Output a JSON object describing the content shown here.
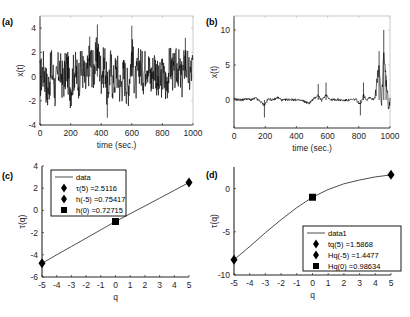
{
  "figure": {
    "panels": [
      "(a)",
      "(b)",
      "(c)",
      "(d)"
    ]
  },
  "chart_data": [
    {
      "id": "a",
      "panel_label": "(a)",
      "type": "line",
      "title": "",
      "xlabel": "time (sec.)",
      "ylabel": "x(t)",
      "xlim": [
        0,
        1000
      ],
      "ylim": [
        -4,
        5
      ],
      "xticks": [
        0,
        200,
        400,
        600,
        800,
        1000
      ],
      "yticks": [
        -4,
        -2,
        0,
        2,
        4
      ],
      "grid": false,
      "description": "Noisy stationary-like time series fluctuating roughly between -3 and 3, peaks near 4.3 at t~375 and ~4.2 at t~600, minimum ~-3.4 at t~440",
      "series": [
        {
          "name": "x(t)",
          "x": [
            0,
            25,
            50,
            75,
            100,
            125,
            150,
            175,
            200,
            225,
            250,
            275,
            300,
            325,
            350,
            375,
            400,
            425,
            440,
            460,
            480,
            500,
            525,
            550,
            575,
            600,
            625,
            650,
            675,
            700,
            725,
            750,
            775,
            800,
            825,
            850,
            875,
            900,
            925,
            950,
            975,
            1000
          ],
          "y": [
            -0.5,
            1.5,
            -2.8,
            1.8,
            -2.5,
            2.0,
            -1.0,
            1.8,
            -2.2,
            1.5,
            -0.5,
            2.0,
            -1.5,
            3.3,
            1.0,
            4.3,
            0.5,
            2.5,
            -3.4,
            2.0,
            -1.5,
            1.8,
            -2.0,
            0.5,
            -2.3,
            4.2,
            -1.5,
            2.5,
            0.5,
            3.0,
            -0.5,
            2.3,
            -1.8,
            0.3,
            -1.5,
            2.5,
            0.2,
            2.3,
            -1.0,
            3.2,
            0.0,
            2.0
          ]
        }
      ]
    },
    {
      "id": "b",
      "panel_label": "(b)",
      "type": "line",
      "title": "",
      "xlabel": "time (sec.)",
      "ylabel": "x(t)",
      "xlim": [
        0,
        1000
      ],
      "ylim": [
        -4,
        12
      ],
      "xticks": [
        0,
        200,
        400,
        600,
        800,
        1000
      ],
      "yticks": [
        0,
        5,
        10
      ],
      "grid": false,
      "description": "Mostly flat series near 0 with small spikes, dip ~-2.5 at t~195, spikes ~2.3 at t~540 and ~2.5 at t~590, dip ~-2.2 at t~810, large bursts near end reaching ~7 at t~930 and ~10 at t~960",
      "series": [
        {
          "name": "x(t)",
          "x": [
            0,
            20,
            50,
            80,
            110,
            140,
            170,
            195,
            220,
            250,
            280,
            310,
            350,
            400,
            440,
            480,
            510,
            540,
            560,
            590,
            620,
            660,
            700,
            740,
            780,
            810,
            830,
            850,
            870,
            890,
            910,
            930,
            945,
            960,
            975,
            990,
            1000
          ],
          "y": [
            0.5,
            0.2,
            0.0,
            0.6,
            0.1,
            0.8,
            -0.8,
            -2.5,
            0.6,
            0.0,
            1.2,
            -0.2,
            0.3,
            0.0,
            -0.3,
            -1.6,
            0.5,
            2.3,
            -0.3,
            2.5,
            0.0,
            0.2,
            -0.2,
            0.0,
            0.3,
            -2.2,
            2.5,
            0.0,
            1.5,
            0.2,
            2.0,
            7.0,
            -1.5,
            10.0,
            3.5,
            -1.0,
            0.0
          ]
        }
      ]
    },
    {
      "id": "c",
      "panel_label": "(c)",
      "type": "line",
      "title": "",
      "xlabel": "q",
      "ylabel": "τ(q)",
      "xlim": [
        -5,
        5
      ],
      "ylim": [
        -6,
        4
      ],
      "xticks": [
        -5,
        -4,
        -3,
        -2,
        -1,
        0,
        1,
        2,
        3,
        4,
        5
      ],
      "yticks": [
        -6,
        -4,
        -2,
        0,
        2,
        4
      ],
      "grid": false,
      "legend_position": "upper-left",
      "series": [
        {
          "name": "data",
          "marker": "none",
          "x": [
            -5,
            -4,
            -3,
            -2,
            -1,
            0,
            1,
            2,
            3,
            4,
            5
          ],
          "y": [
            -4.77,
            -4.0,
            -3.25,
            -2.5,
            -1.75,
            -1.0,
            -0.3,
            0.4,
            1.1,
            1.8,
            2.51
          ]
        },
        {
          "name": "τ(5) =2.5116",
          "marker": "diamond",
          "x": [
            5
          ],
          "y": [
            2.51
          ]
        },
        {
          "name": "h(-5) =0.75417",
          "marker": "diamond",
          "x": [
            -5
          ],
          "y": [
            -4.77
          ]
        },
        {
          "name": "h(0) =0.72715",
          "marker": "square",
          "x": [
            0
          ],
          "y": [
            -1.0
          ]
        }
      ],
      "legend": [
        "data",
        "τ(5) =2.5116",
        "h(-5) =0.75417",
        "h(0) =0.72715"
      ]
    },
    {
      "id": "d",
      "panel_label": "(d)",
      "type": "line",
      "title": "",
      "xlabel": "q",
      "ylabel": "τ(q)",
      "xlim": [
        -5,
        5
      ],
      "ylim": [
        -10,
        2.5
      ],
      "xticks": [
        -5,
        -4,
        -3,
        -2,
        -1,
        0,
        1,
        2,
        3,
        4,
        5
      ],
      "yticks": [
        -10,
        -5,
        0
      ],
      "grid": false,
      "legend_position": "lower-right",
      "series": [
        {
          "name": "data1",
          "marker": "none",
          "x": [
            -5,
            -4,
            -3,
            -2,
            -1,
            0,
            1,
            2,
            3,
            4,
            5
          ],
          "y": [
            -8.24,
            -6.7,
            -5.1,
            -3.6,
            -2.2,
            -1.0,
            -0.1,
            0.55,
            1.0,
            1.35,
            1.59
          ]
        },
        {
          "name": "tq(5) =1.5868",
          "marker": "diamond",
          "x": [
            5
          ],
          "y": [
            1.59
          ]
        },
        {
          "name": "Hq(-5) =1.4477",
          "marker": "diamond",
          "x": [
            -5
          ],
          "y": [
            -8.24
          ]
        },
        {
          "name": "Hq(0) =0.98634",
          "marker": "square",
          "x": [
            0
          ],
          "y": [
            -1.0
          ]
        }
      ],
      "legend": [
        "data1",
        "tq(5) =1.5868",
        "Hq(-5) =1.4477",
        "Hq(0) =0.98634"
      ]
    }
  ],
  "layout": {
    "a": {
      "left": 40,
      "top": 16,
      "right": 193,
      "bottom": 125
    },
    "b": {
      "left": 234,
      "top": 16,
      "right": 390,
      "bottom": 128
    },
    "c": {
      "left": 42,
      "top": 166,
      "right": 189,
      "bottom": 277
    },
    "d": {
      "left": 234,
      "top": 167,
      "right": 391,
      "bottom": 275
    }
  },
  "colors": {
    "line": "#000000",
    "axis": "#262626",
    "box": "#bdbdbd"
  }
}
